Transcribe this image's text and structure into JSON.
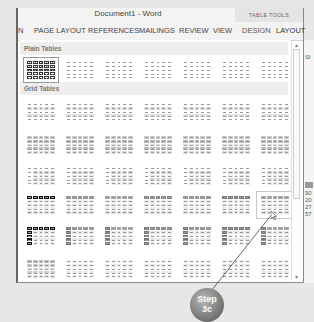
{
  "window": {
    "title": "Document1 - Word",
    "contextual_group": "TABLE TOOLS"
  },
  "ribbon": {
    "tabs": [
      {
        "label": "N"
      },
      {
        "label": "PAGE LAYOUT"
      },
      {
        "label": "REFERENCES"
      },
      {
        "label": "MAILINGS"
      },
      {
        "label": "REVIEW"
      },
      {
        "label": "VIEW"
      },
      {
        "label": "DESIGN"
      },
      {
        "label": "LAYOUT"
      }
    ]
  },
  "gallery": {
    "sections": [
      {
        "label": "Plain Tables"
      },
      {
        "label": "Grid Tables"
      }
    ],
    "scroll_up": "▲",
    "scroll_down": "▼"
  },
  "side_text": [
    "Sł",
    "90",
    "20",
    "27",
    "57"
  ],
  "callout": {
    "line1": "Step",
    "line2": "3c"
  }
}
